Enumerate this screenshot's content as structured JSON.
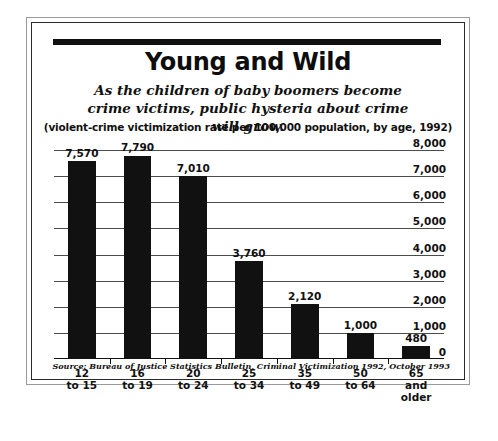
{
  "figure": {
    "headline": "Young and Wild",
    "deck": "As the children of baby boomers become crime victims, public hysteria about crime will grow.",
    "units_note": "(violent-crime victimization rate per 100,000 population, by age, 1992)",
    "source": "Source: Bureau of Justice Statistics Bulletin, Criminal Victimization 1992, October 1993",
    "ink_color": "#111111",
    "grid_color": "#4c4c4c",
    "background": "#ffffff"
  },
  "chart_data": {
    "type": "bar",
    "title": "Young and Wild",
    "subtitle": "As the children of baby boomers become crime victims, public hysteria about crime will grow.",
    "xlabel": "",
    "ylabel": "(violent-crime victimization rate per 100,000 population, by age, 1992)",
    "categories": [
      "12 to 15",
      "16 to 19",
      "20 to 24",
      "25 to 34",
      "35 to 49",
      "50 to 64",
      "65 and older"
    ],
    "values": [
      7570,
      7790,
      7010,
      3760,
      2120,
      1000,
      480
    ],
    "value_labels": [
      "7,570",
      "7,790",
      "7,010",
      "3,760",
      "2,120",
      "1,000",
      "480"
    ],
    "ylim": [
      0,
      8000
    ],
    "ytick_values": [
      0,
      1000,
      2000,
      3000,
      4000,
      5000,
      6000,
      7000,
      8000
    ],
    "ytick_labels": [
      "0",
      "1,000",
      "2,000",
      "3,000",
      "4,000",
      "5,000",
      "6,000",
      "7,000",
      "8,000"
    ],
    "yaxis_position": "right",
    "grid": true,
    "legend": false,
    "bar_color": "#111111"
  }
}
